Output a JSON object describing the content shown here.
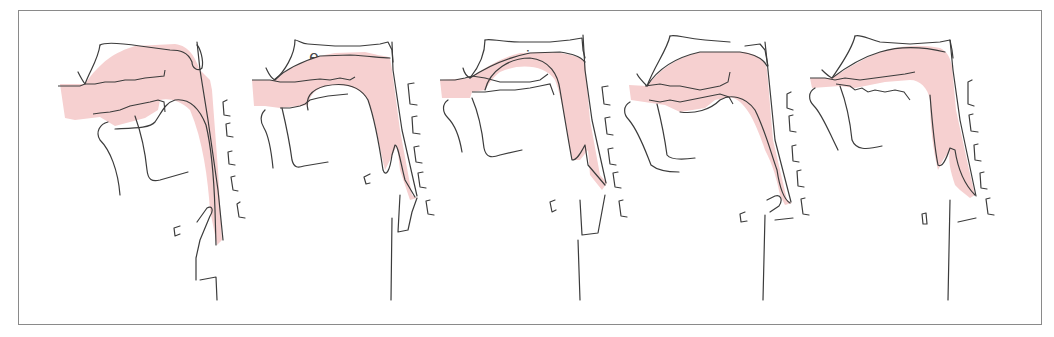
{
  "figure": {
    "type": "vowel-articulation-sagittal-sections",
    "tract_fill_color": "#F6D0D0",
    "line_color": "#3c3c3c",
    "border_color": "#8a8a8a",
    "panels": [
      {
        "label": "a"
      },
      {
        "label": "e"
      },
      {
        "label": "i"
      },
      {
        "label": "o"
      },
      {
        "label": "u"
      }
    ]
  }
}
